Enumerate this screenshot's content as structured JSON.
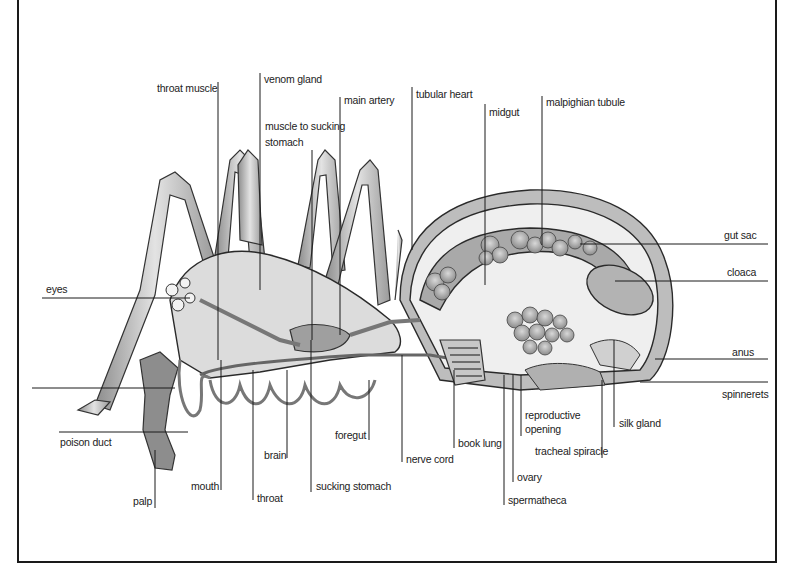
{
  "diagram": {
    "labels": {
      "throat_muscle": "throat muscle",
      "venom_gland": "venom gland",
      "main_artery": "main artery",
      "muscle_to_sucking_stomach_1": "muscle to sucking",
      "muscle_to_sucking_stomach_2": "stomach",
      "tubular_heart": "tubular heart",
      "midgut": "midgut",
      "malpighian_tubule": "malpighian tubule",
      "gut_sac": "gut sac",
      "cloaca": "cloaca",
      "anus": "anus",
      "spinnerets": "spinnerets",
      "eyes": "eyes",
      "poison_duct": "poison duct",
      "palp": "palp",
      "mouth": "mouth",
      "throat": "throat",
      "brain": "brain",
      "sucking_stomach": "sucking stomach",
      "foregut": "foregut",
      "nerve_cord": "nerve cord",
      "book_lung": "book lung",
      "ovary": "ovary",
      "spermatheca": "spermatheca",
      "reproductive_opening_1": "reproductive",
      "reproductive_opening_2": "opening",
      "tracheal_spiracle": "tracheal spiracle",
      "silk_gland": "silk gland"
    },
    "colors": {
      "line": "#1a1a1a",
      "tissue_light": "#d9d9d9",
      "tissue_mid": "#a8a8a8",
      "tissue_dark": "#7a7a7a",
      "background": "#ffffff"
    }
  }
}
